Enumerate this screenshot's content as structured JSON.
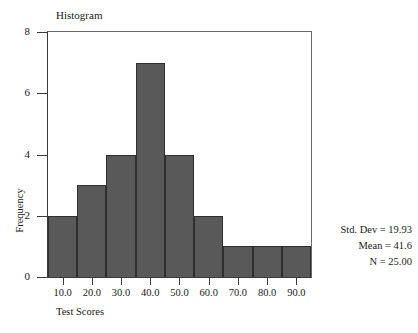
{
  "chart_data": {
    "type": "bar",
    "title": "Histogram",
    "xlabel": "Test Scores",
    "ylabel": "Frequency",
    "categories": [
      "10.0",
      "20.0",
      "30.0",
      "40.0",
      "50.0",
      "60.0",
      "70.0",
      "80.0",
      "90.0"
    ],
    "values": [
      2,
      3,
      4,
      7,
      4,
      2,
      1,
      1,
      1
    ],
    "xtick_labels": [
      "10.0",
      "20.0",
      "30.0",
      "40.0",
      "50.0",
      "60.0",
      "70.0",
      "80.0",
      "90.0"
    ],
    "ytick_labels": [
      "0",
      "2",
      "4",
      "6",
      "8"
    ],
    "ytick_values": [
      0,
      2,
      4,
      6,
      8
    ],
    "ylim": [
      0,
      8
    ],
    "grid": false,
    "legend": "none",
    "bar_color": "#595959",
    "bar_edge_color": "#2e2e2e",
    "axis_color": "#3a3a3a",
    "frame_color": "#6a6a6a"
  },
  "stats": {
    "std_dev": "Std. Dev = 19.93",
    "mean": "Mean = 41.6",
    "n": "N = 25.00"
  }
}
